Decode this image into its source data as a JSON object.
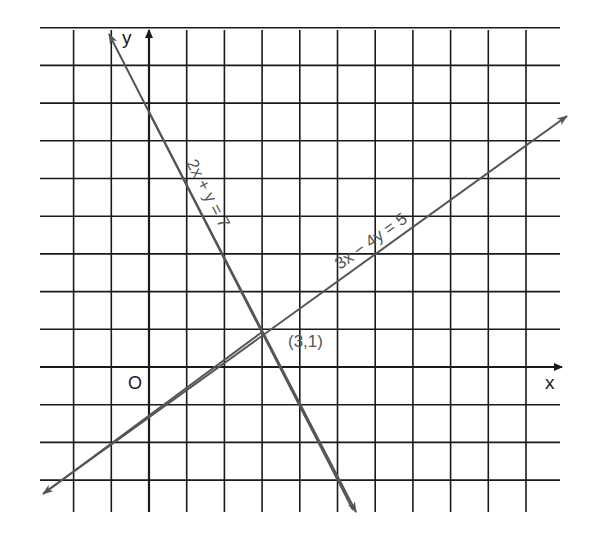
{
  "chart_data": {
    "type": "line",
    "title": "",
    "xlabel": "x",
    "ylabel": "y",
    "origin_label": "O",
    "xlim": [
      -2,
      10
    ],
    "ylim": [
      -3,
      9
    ],
    "grid": true,
    "grid_step": 1,
    "series": [
      {
        "name": "2x + y = 7",
        "equation": "2x + y = 7",
        "slope": -2,
        "intercept": 7,
        "x": [
          -1.1,
          5.4
        ],
        "y": [
          9.2,
          -3.8
        ]
      },
      {
        "name": "3x − 4y = 5",
        "equation": "3x − 4y = 5",
        "slope": 0.75,
        "intercept": -1.25,
        "x": [
          -2.8,
          11.2
        ],
        "y": [
          -3.35,
          7.15
        ]
      }
    ],
    "annotations": [
      {
        "text": "(3,1)",
        "x": 3,
        "y": 1,
        "note": "intersection point"
      }
    ]
  },
  "labels": {
    "x_axis": "x",
    "y_axis": "y",
    "origin": "O",
    "line1": "2x + y = 7",
    "line2": "3x − 4y = 5",
    "intersection": "(3,1)"
  },
  "colors": {
    "grid": "#1a1a1a",
    "lines": "#555555",
    "text": "#1a1a1a"
  }
}
